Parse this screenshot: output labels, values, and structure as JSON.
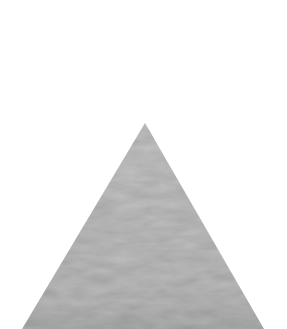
{
  "image": {
    "description": "Gray felt-textured triangle on white background",
    "background_color": "#ffffff",
    "shape": {
      "type": "triangle",
      "apex": [
        145,
        123
      ],
      "base_left": [
        22,
        329
      ],
      "base_right": [
        264,
        329
      ],
      "fill_color": "#bdbdbd",
      "fill_light": "#c6c6c6",
      "fill_dark": "#acacac",
      "texture": "wavy felt"
    }
  }
}
